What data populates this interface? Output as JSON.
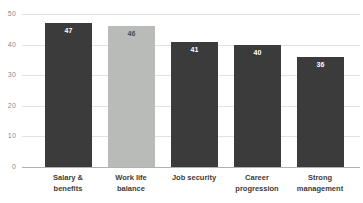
{
  "chart_data": {
    "type": "bar",
    "title": "",
    "subtitle": "",
    "xlabel": "",
    "ylabel": "",
    "categories": [
      "Salary & benefits",
      "Work life balance",
      "Job security",
      "Career progression",
      "Strong management"
    ],
    "category_lines": [
      [
        "Salary &",
        "benefits"
      ],
      [
        "Work life",
        "balance"
      ],
      [
        "Job security",
        ""
      ],
      [
        "Career",
        "progression"
      ],
      [
        "Strong",
        "management"
      ]
    ],
    "values": [
      47,
      46,
      41,
      40,
      36
    ],
    "value_labels": [
      "47",
      "46",
      "41",
      "40",
      "36"
    ],
    "ylim": [
      0,
      50
    ],
    "yticks": [
      0,
      10,
      20,
      30,
      40,
      50
    ],
    "ytick_labels": [
      "0",
      "10",
      "20",
      "30",
      "40",
      "50"
    ],
    "grid": true,
    "legend": false,
    "bar_colors": [
      "#3b3b3b",
      "#b9bbb9",
      "#3b3b3b",
      "#3b3b3b",
      "#3b3b3b"
    ],
    "highlight_index": 1,
    "colors": {
      "bar_dark": "#3b3b3b",
      "bar_light": "#b9bbb9",
      "gridline": "#e2e2e2",
      "axis": "#b0b0b0",
      "tick_text": "#8b8b8b",
      "category_text": "#3b3b3b",
      "value_text_on_dark": "#ffffff",
      "value_text_on_light": "#4a4a4a",
      "background": "#ffffff"
    }
  }
}
